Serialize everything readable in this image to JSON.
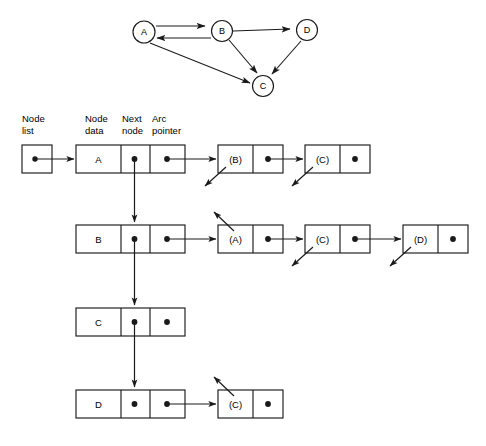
{
  "figure": {
    "colors": {
      "ink": "#1a1a1a",
      "paper": "#ffffff"
    }
  },
  "graph": {
    "nodes": [
      {
        "id": "A",
        "label": "A",
        "cx": 144,
        "cy": 32,
        "r": 11
      },
      {
        "id": "B",
        "label": "B",
        "cx": 222,
        "cy": 30,
        "r": 10.5
      },
      {
        "id": "D",
        "label": "D",
        "cx": 307,
        "cy": 30,
        "r": 10.5
      },
      {
        "id": "C",
        "label": "C",
        "cx": 263,
        "cy": 86,
        "r": 10.5
      }
    ],
    "edges": [
      {
        "from": "A",
        "to": "B"
      },
      {
        "from": "B",
        "to": "A"
      },
      {
        "from": "B",
        "to": "D"
      },
      {
        "from": "B",
        "to": "C"
      },
      {
        "from": "A",
        "to": "C"
      },
      {
        "from": "D",
        "to": "C"
      }
    ]
  },
  "column_labels": {
    "node_list": "Node\nlist",
    "node_list_line1": "Node",
    "node_list_line2": "list",
    "node_data_line1": "Node",
    "node_data_line2": "data",
    "next_node_line1": "Next",
    "next_node_line2": "node",
    "arc_pointer_line1": "Arc",
    "arc_pointer_line2": "pointer"
  },
  "node_list_head": {
    "name": "node-list-head",
    "has_pointer": true
  },
  "rows": [
    {
      "id": "row-a",
      "data": "A",
      "next_node_link": true,
      "arc_pointer_link": true,
      "arcs": [
        {
          "label": "(B)",
          "pointer_link": true,
          "in_arrow": "down-left"
        },
        {
          "label": "(C)",
          "pointer_link": false,
          "in_arrow": "down-left"
        }
      ]
    },
    {
      "id": "row-b",
      "data": "B",
      "next_node_link": true,
      "arc_pointer_link": true,
      "arcs": [
        {
          "label": "(A)",
          "pointer_link": true,
          "in_arrow": "up-left"
        },
        {
          "label": "(C)",
          "pointer_link": true,
          "in_arrow": "down-left"
        },
        {
          "label": "(D)",
          "pointer_link": false,
          "in_arrow": "down-left"
        }
      ]
    },
    {
      "id": "row-c",
      "data": "C",
      "next_node_link": true,
      "arc_pointer_link": false,
      "arcs": []
    },
    {
      "id": "row-d",
      "data": "D",
      "next_node_link": false,
      "arc_pointer_link": true,
      "arcs": [
        {
          "label": "(C)",
          "pointer_link": false,
          "in_arrow": "up-left"
        }
      ]
    }
  ]
}
